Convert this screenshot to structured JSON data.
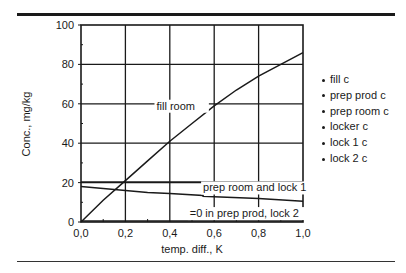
{
  "chart_data": {
    "type": "line",
    "title": "",
    "xlabel": "temp. diff., K",
    "ylabel": "Conc., mg/kg",
    "xlim": [
      0,
      1.0
    ],
    "ylim": [
      0,
      100
    ],
    "grid": true,
    "x_ticks": [
      "0,0",
      "0,2",
      "0,4",
      "0,6",
      "0,8",
      "1,0"
    ],
    "y_ticks": [
      "0",
      "20",
      "40",
      "60",
      "80",
      "100"
    ],
    "series": [
      {
        "name": "fill room",
        "x": [
          0,
          0.1,
          0.2,
          0.3,
          0.4,
          0.5,
          0.6,
          0.7,
          0.8,
          0.9,
          1.0
        ],
        "y": [
          0,
          11,
          21,
          31,
          41,
          50,
          59,
          67,
          74,
          80,
          86
        ]
      },
      {
        "name": "prep room and lock 1",
        "x": [
          0,
          0.1,
          0.2,
          0.3,
          0.4,
          0.55,
          0.55,
          0.6,
          0.8,
          1.0
        ],
        "y": [
          18,
          17,
          16,
          15,
          14.5,
          13.5,
          13,
          12.8,
          12,
          10.5
        ]
      },
      {
        "name": "=0 in prep prod, lock 2",
        "x": [
          0,
          1.0
        ],
        "y": [
          0.5,
          0.5
        ]
      },
      {
        "name": "reference 20",
        "x": [
          0,
          1.0
        ],
        "y": [
          20.3,
          20.3
        ]
      }
    ],
    "annotations": [
      {
        "text": "fill room",
        "x": 0.34,
        "y": 57
      },
      {
        "text": "prep room and lock 1",
        "x": 0.55,
        "y": 15.5
      },
      {
        "text": "=0 in prep prod, lock 2",
        "x": 0.49,
        "y": 2.5
      }
    ],
    "legend": {
      "placement": "right",
      "entries": [
        "fill c",
        "prep prod c",
        "prep room c",
        "locker c",
        "lock 1 c",
        "lock 2 c"
      ]
    }
  }
}
